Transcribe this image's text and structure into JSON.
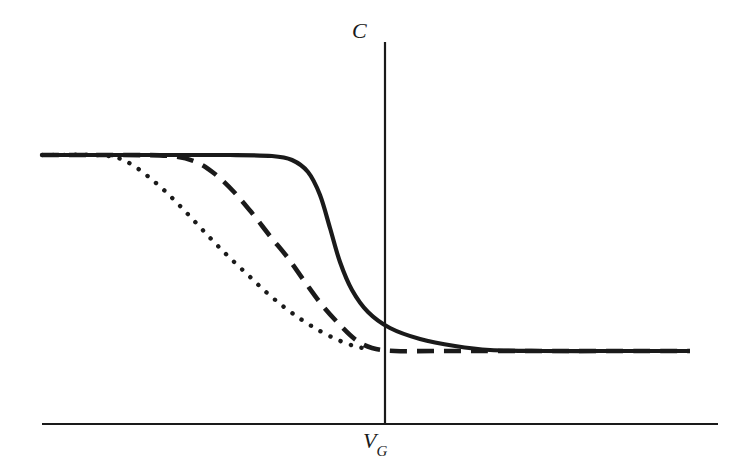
{
  "figure": {
    "background_color": "#ffffff",
    "ink_color": "#1a1a1a"
  },
  "axes": {
    "y_label_text": "C",
    "x_label_main": "V",
    "x_label_sub": "G",
    "x_axis": {
      "x_start": 42,
      "x_end": 718,
      "y": 424,
      "stroke_width": 2.2
    },
    "y_axis": {
      "x": 385,
      "y_start": 42,
      "y_end": 424,
      "stroke_width": 2.2
    }
  },
  "chart_data": {
    "type": "line",
    "title": "",
    "xlabel": "V_G",
    "ylabel": "C",
    "grid": false,
    "legend": null,
    "axis_style": "schematic, no tick marks, no numeric tick labels",
    "x_axis_origin_px": 385,
    "plateau_high_level": 1.0,
    "plateau_low_level": 0.23,
    "series": [
      {
        "name": "solid-curve",
        "style": "solid",
        "stroke_width": 4.2,
        "dasharray": "none",
        "comment": "Sharpest transition, ideal-like; rides high plateau furthest right then drops steeply near V_G",
        "points_px": [
          [
            42,
            155
          ],
          [
            150,
            155
          ],
          [
            230,
            155
          ],
          [
            272,
            156
          ],
          [
            292,
            160
          ],
          [
            308,
            172
          ],
          [
            320,
            195
          ],
          [
            330,
            228
          ],
          [
            340,
            262
          ],
          [
            352,
            290
          ],
          [
            368,
            312
          ],
          [
            390,
            328
          ],
          [
            420,
            339
          ],
          [
            455,
            346
          ],
          [
            490,
            350
          ],
          [
            540,
            351
          ],
          [
            600,
            351
          ],
          [
            660,
            351
          ],
          [
            690,
            351
          ]
        ],
        "x_values_norm": [
          -3.4,
          -2.3,
          -1.5,
          -1.1,
          -0.9,
          -0.75,
          -0.63,
          -0.53,
          -0.43,
          -0.32,
          -0.16,
          0.05,
          0.35,
          0.68,
          1.02,
          1.5,
          2.1,
          2.7,
          3.0
        ],
        "y_values_norm": [
          1.0,
          1.0,
          1.0,
          0.995,
          0.98,
          0.935,
          0.85,
          0.72,
          0.6,
          0.49,
          0.41,
          0.35,
          0.31,
          0.29,
          0.277,
          0.274,
          0.274,
          0.274,
          0.274
        ]
      },
      {
        "name": "dashed-curve",
        "style": "dashed",
        "stroke_width": 4.6,
        "dasharray": "17 10",
        "comment": "Intermediate stretch-out; departs plateau near x=185px, reaches low plateau near x=365px and continues flat to the right edge",
        "points_px": [
          [
            42,
            155
          ],
          [
            120,
            155
          ],
          [
            170,
            156
          ],
          [
            196,
            162
          ],
          [
            215,
            174
          ],
          [
            234,
            192
          ],
          [
            252,
            213
          ],
          [
            270,
            236
          ],
          [
            288,
            258
          ],
          [
            305,
            282
          ],
          [
            322,
            305
          ],
          [
            340,
            325
          ],
          [
            356,
            340
          ],
          [
            372,
            348
          ],
          [
            395,
            351
          ],
          [
            440,
            351
          ],
          [
            500,
            351
          ],
          [
            570,
            351
          ],
          [
            640,
            351
          ],
          [
            690,
            351
          ]
        ],
        "x_values_norm": [
          -3.4,
          -2.6,
          -2.1,
          -1.85,
          -1.65,
          -1.47,
          -1.28,
          -1.1,
          -0.92,
          -0.75,
          -0.58,
          -0.41,
          -0.26,
          -0.11,
          0.09,
          0.52,
          1.12,
          1.8,
          2.5,
          3.0
        ],
        "y_values_norm": [
          1.0,
          1.0,
          0.995,
          0.98,
          0.935,
          0.87,
          0.79,
          0.7,
          0.62,
          0.53,
          0.45,
          0.38,
          0.33,
          0.3,
          0.274,
          0.274,
          0.274,
          0.274,
          0.274
        ]
      },
      {
        "name": "dotted-curve",
        "style": "dotted",
        "stroke_width": 4.4,
        "dasharray": "0.1 11",
        "comment": "Largest stretch-out; departs plateau earliest near x=110px and descends most gradually, merging with the low plateau near x=368px",
        "points_px": [
          [
            42,
            155
          ],
          [
            95,
            155
          ],
          [
            118,
            158
          ],
          [
            134,
            166
          ],
          [
            150,
            178
          ],
          [
            166,
            192
          ],
          [
            182,
            208
          ],
          [
            198,
            225
          ],
          [
            214,
            242
          ],
          [
            230,
            258
          ],
          [
            248,
            275
          ],
          [
            266,
            292
          ],
          [
            284,
            307
          ],
          [
            302,
            320
          ],
          [
            320,
            331
          ],
          [
            338,
            340
          ],
          [
            354,
            346
          ],
          [
            368,
            349
          ]
        ],
        "x_values_norm": [
          -3.4,
          -2.9,
          -2.7,
          -2.55,
          -2.4,
          -2.25,
          -2.1,
          -1.95,
          -1.8,
          -1.65,
          -1.48,
          -1.3,
          -1.12,
          -0.95,
          -0.77,
          -0.6,
          -0.45,
          -0.31
        ],
        "y_values_norm": [
          1.0,
          1.0,
          0.99,
          0.96,
          0.92,
          0.866,
          0.8,
          0.74,
          0.675,
          0.615,
          0.55,
          0.485,
          0.43,
          0.38,
          0.34,
          0.31,
          0.29,
          0.278
        ]
      }
    ]
  }
}
